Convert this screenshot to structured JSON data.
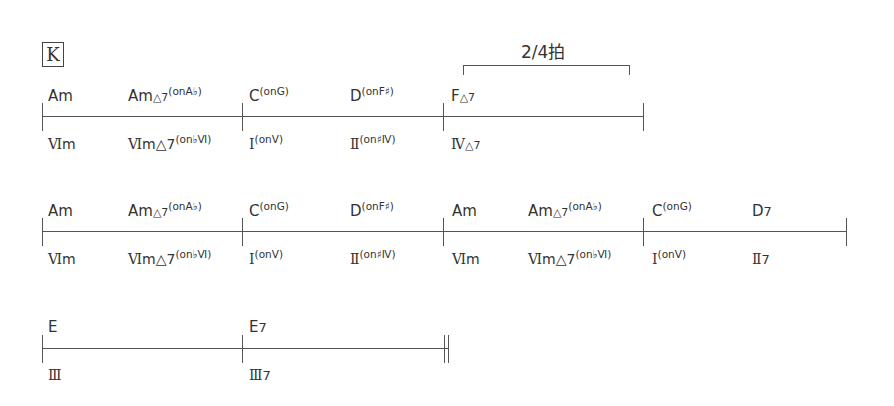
{
  "section": {
    "rehearsal_mark": "K"
  },
  "annotation": {
    "label": "2/4拍"
  },
  "systems": [
    {
      "chords": [
        {
          "root": "Am",
          "quality": "",
          "bass": ""
        },
        {
          "root": "Am",
          "quality": "△7",
          "bass": "(onA♭)"
        },
        {
          "root": "C",
          "quality": "",
          "bass": "(onG)"
        },
        {
          "root": "D",
          "quality": "",
          "bass": "(onF♯)"
        },
        {
          "root": "F",
          "quality": "△7",
          "bass": ""
        }
      ],
      "degrees": [
        {
          "numeral": "Ⅵ",
          "suffix": "m",
          "bass": ""
        },
        {
          "numeral": "Ⅵ",
          "suffix": "m△7",
          "bass": "(on♭Ⅵ)"
        },
        {
          "numeral": "Ⅰ",
          "suffix": "",
          "bass": "(onⅤ)"
        },
        {
          "numeral": "Ⅱ",
          "suffix": "",
          "bass": "(on♯Ⅳ)"
        },
        {
          "numeral": "Ⅳ",
          "suffix": "△7",
          "bass": ""
        }
      ]
    },
    {
      "chords": [
        {
          "root": "Am",
          "quality": "",
          "bass": ""
        },
        {
          "root": "Am",
          "quality": "△7",
          "bass": "(onA♭)"
        },
        {
          "root": "C",
          "quality": "",
          "bass": "(onG)"
        },
        {
          "root": "D",
          "quality": "",
          "bass": "(onF♯)"
        },
        {
          "root": "Am",
          "quality": "",
          "bass": ""
        },
        {
          "root": "Am",
          "quality": "△7",
          "bass": "(onA♭)"
        },
        {
          "root": "C",
          "quality": "",
          "bass": "(onG)"
        },
        {
          "root": "D",
          "quality": "7",
          "bass": ""
        }
      ],
      "degrees": [
        {
          "numeral": "Ⅵ",
          "suffix": "m",
          "bass": ""
        },
        {
          "numeral": "Ⅵ",
          "suffix": "m△7",
          "bass": "(on♭Ⅵ)"
        },
        {
          "numeral": "Ⅰ",
          "suffix": "",
          "bass": "(onⅤ)"
        },
        {
          "numeral": "Ⅱ",
          "suffix": "",
          "bass": "(on♯Ⅳ)"
        },
        {
          "numeral": "Ⅵ",
          "suffix": "m",
          "bass": ""
        },
        {
          "numeral": "Ⅵ",
          "suffix": "m△7",
          "bass": "(on♭Ⅵ)"
        },
        {
          "numeral": "Ⅰ",
          "suffix": "",
          "bass": "(onⅤ)"
        },
        {
          "numeral": "Ⅱ",
          "suffix": "7",
          "bass": ""
        }
      ]
    },
    {
      "chords": [
        {
          "root": "E",
          "quality": "",
          "bass": ""
        },
        {
          "root": "E",
          "quality": "7",
          "bass": ""
        }
      ],
      "degrees": [
        {
          "numeral": "Ⅲ",
          "suffix": "",
          "bass": ""
        },
        {
          "numeral": "Ⅲ",
          "suffix": "7",
          "bass": ""
        }
      ]
    }
  ]
}
